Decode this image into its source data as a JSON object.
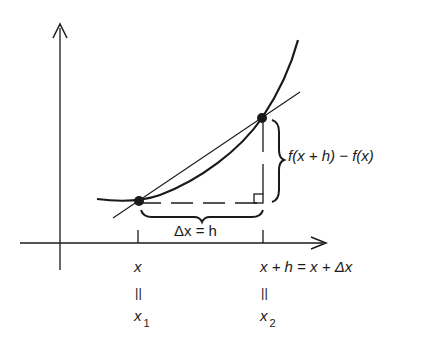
{
  "diagram": {
    "labels": {
      "vertical_diff": "f(x + h) − f(x)",
      "horizontal_diff": "Δx = h",
      "x_label": "x",
      "x_equals": "||",
      "x1": "x",
      "x1_sub": "1",
      "xh_label": "x + h = x + Δx",
      "xh_equals": "||",
      "x2": "x",
      "x2_sub": "2"
    },
    "points": [
      {
        "name": "P1",
        "cx": 139,
        "cy": 201
      },
      {
        "name": "P2",
        "cx": 262,
        "cy": 118
      }
    ],
    "colors": {
      "ink": "#1a1a1a",
      "background": "#ffffff"
    }
  }
}
